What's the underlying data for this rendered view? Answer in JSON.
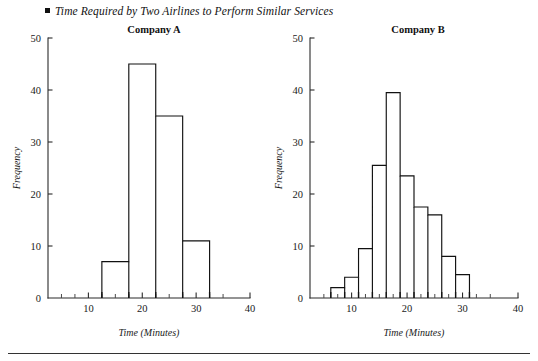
{
  "figure": {
    "title": "Time Required by Two Airlines to Perform Similar Services",
    "bullet_icon": "square-bullet-icon",
    "background_color": "#ffffff",
    "line_color": "#111111"
  },
  "panels": {
    "a": {
      "title": "Company A",
      "xlabel": "Time (Minutes)",
      "ylabel": "Frequency"
    },
    "b": {
      "title": "Company B",
      "xlabel": "Time (Minutes)",
      "ylabel": "Frequency"
    }
  },
  "chart_data": [
    {
      "type": "bar",
      "title": "Company A",
      "subtitle": "Time Required by Two Airlines to Perform Similar Services",
      "xlabel": "Time (Minutes)",
      "ylabel": "Frequency",
      "xlim": [
        2.5,
        40
      ],
      "ylim": [
        0,
        50
      ],
      "xticks": [
        10,
        20,
        30,
        40
      ],
      "xticklabels": [
        "10",
        "20",
        "30",
        "40"
      ],
      "xminorticks": [
        5,
        7.5,
        12.5,
        15,
        17.5,
        22.5,
        25,
        27.5,
        32.5,
        35
      ],
      "yticks": [
        0,
        10,
        20,
        30,
        40,
        50
      ],
      "yticklabels": [
        "0",
        "10",
        "20",
        "30",
        "40",
        "50"
      ],
      "grid": false,
      "legend": "none",
      "bin_edges": [
        12.5,
        17.5,
        22.5,
        27.5,
        32.5
      ],
      "categories": [
        "12.5-17.5",
        "17.5-22.5",
        "22.5-27.5",
        "27.5-32.5"
      ],
      "values": [
        7,
        45,
        35,
        11
      ]
    },
    {
      "type": "bar",
      "title": "Company B",
      "subtitle": "Time Required by Two Airlines to Perform Similar Services",
      "xlabel": "Time (Minutes)",
      "ylabel": "Frequency",
      "xlim": [
        2.5,
        40
      ],
      "ylim": [
        0,
        50
      ],
      "xticks": [
        10,
        20,
        30,
        40
      ],
      "xticklabels": [
        "10",
        "20",
        "30",
        "40"
      ],
      "xminorticks": [
        5,
        7.5,
        12.5,
        15,
        17.5,
        22.5,
        25,
        27.5,
        32.5,
        35
      ],
      "yticks": [
        0,
        10,
        20,
        30,
        40,
        50
      ],
      "yticklabels": [
        "0",
        "10",
        "20",
        "30",
        "40",
        "50"
      ],
      "grid": false,
      "legend": "none",
      "bin_edges": [
        6.25,
        8.75,
        11.25,
        13.75,
        16.25,
        18.75,
        21.25,
        23.75,
        26.25,
        28.75,
        31.25
      ],
      "categories": [
        "6.25-8.75",
        "8.75-11.25",
        "11.25-13.75",
        "13.75-16.25",
        "16.25-18.75",
        "18.75-21.25",
        "21.25-23.75",
        "23.75-26.25",
        "26.25-28.75",
        "28.75-31.25"
      ],
      "values": [
        2,
        4,
        9.5,
        25.5,
        39.5,
        23.5,
        17.5,
        16,
        8,
        4.5
      ]
    }
  ]
}
